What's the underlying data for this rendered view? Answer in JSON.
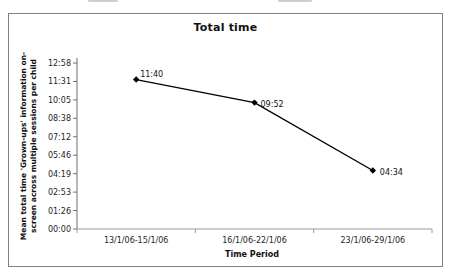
{
  "window": {
    "background": "#ffffff",
    "frame_border_color": "#818181"
  },
  "chart_data": {
    "type": "line",
    "title": "Total time",
    "xlabel": "Time Period",
    "ylabel": "Mean total time 'Grown-ups' information on-screen across multiple sessions per child",
    "ylabel_lines": [
      "Mean total time 'Grown-ups' information on-",
      "screen across multiple sessions per child"
    ],
    "categories": [
      "13/1/06-15/1/06",
      "16/1/06-22/1/06",
      "23/1/06-29/1/06"
    ],
    "series": [
      {
        "name": "Total time",
        "point_labels": [
          "11:40",
          "09:52",
          "04:34"
        ],
        "values_minutes": [
          700,
          592,
          274
        ]
      }
    ],
    "y_tick_labels": [
      "00:00",
      "01:26",
      "02:53",
      "04:19",
      "05:46",
      "07:12",
      "08:38",
      "10:05",
      "11:31",
      "12:58"
    ],
    "y_tick_minutes": [
      0,
      86.4,
      172.8,
      259.2,
      345.6,
      432,
      518.4,
      604.8,
      691.2,
      777.6
    ],
    "ylim_minutes": [
      0,
      777.6
    ],
    "grid": false,
    "legend_position": "none",
    "line_color": "#000000",
    "marker": "diamond",
    "marker_color": "#000000",
    "text_color": "#262626",
    "axis_color": "#7a7a7a"
  }
}
